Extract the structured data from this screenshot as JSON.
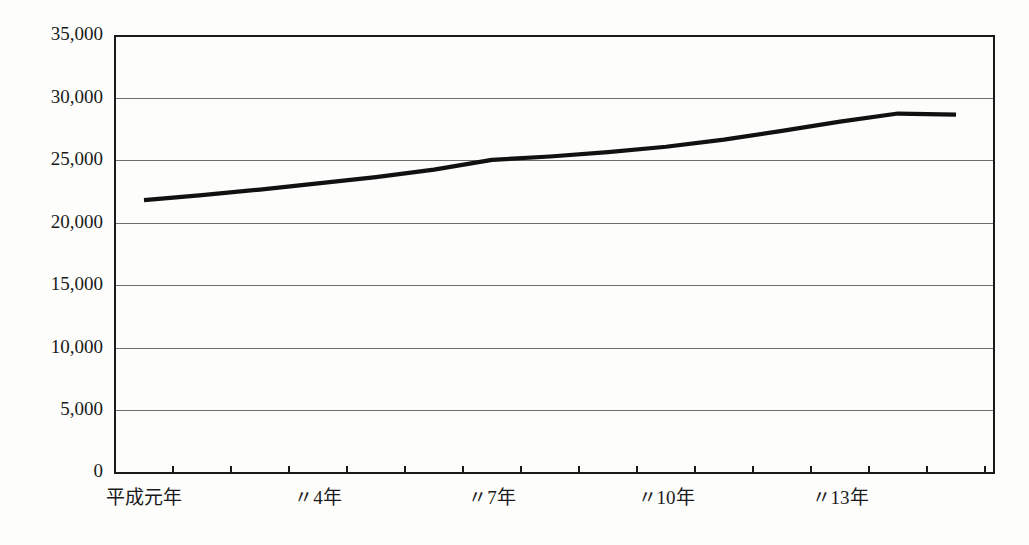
{
  "chart_data": {
    "type": "line",
    "title": "",
    "subtitle": "",
    "xlabel": "",
    "ylabel": "",
    "grid": true,
    "legend": false,
    "legend_position": "none",
    "ylim": [
      0,
      35000
    ],
    "ytick_labels": [
      "35,000",
      "30,000",
      "25,000",
      "20,000",
      "15,000",
      "10,000",
      "5,000",
      "0"
    ],
    "ytick_values": [
      35000,
      30000,
      25000,
      20000,
      15000,
      10000,
      5000,
      0
    ],
    "xtick_labels": [
      "平成元年",
      "〃4年",
      "〃7年",
      "〃10年",
      "〃13年"
    ],
    "xtick_label_categories": [
      "平成元年",
      "平成4年",
      "平成7年",
      "平成10年",
      "平成13年"
    ],
    "categories": [
      "平成元年",
      "平成2年",
      "平成3年",
      "平成4年",
      "平成5年",
      "平成6年",
      "平成7年",
      "平成8年",
      "平成9年",
      "平成10年",
      "平成11年",
      "平成12年",
      "平成13年",
      "平成14年",
      "平成15年"
    ],
    "x": [
      1,
      2,
      3,
      4,
      5,
      6,
      7,
      8,
      9,
      10,
      11,
      12,
      13,
      14,
      15
    ],
    "values": [
      21850,
      22250,
      22700,
      23200,
      23700,
      24300,
      25080,
      25350,
      25700,
      26130,
      26700,
      27400,
      28140,
      28790,
      28700
    ],
    "series": [
      {
        "name": "件数",
        "color": "#111111",
        "values": [
          21850,
          22250,
          22700,
          23200,
          23700,
          24300,
          25080,
          25350,
          25700,
          26130,
          26700,
          27400,
          28140,
          28790,
          28700
        ]
      }
    ]
  },
  "colors": {
    "line": "#111111",
    "grid": "#6e6e6e",
    "border": "#1a1a1a",
    "text": "#1a1a1a",
    "background": "#fdfdfb"
  }
}
